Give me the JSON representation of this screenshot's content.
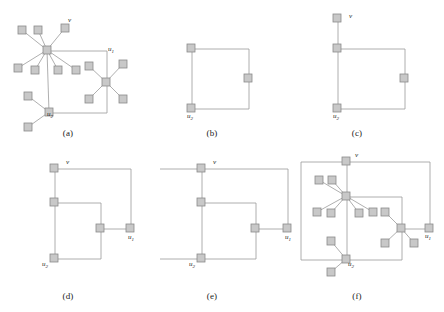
{
  "figure": {
    "background_color": "#ffffff",
    "node_fill": "#c8c8c8",
    "node_stroke": "#8a8a8a",
    "edge_color": "#9a9a9a",
    "label_color": "#1a1a1a",
    "vertex_labels": {
      "v": "v",
      "u1_base": "u",
      "u1_sub": "1",
      "u2_base": "u",
      "u2_sub": "2"
    }
  },
  "panels": [
    {
      "id": "a",
      "caption": "(a)",
      "caption_x": 48,
      "caption_y": 128,
      "origin_x": 2,
      "origin_y": 6,
      "labels": [
        {
          "name": "v",
          "base": "v",
          "sub": "",
          "x": 66,
          "y": 16
        },
        {
          "name": "u1",
          "base": "u",
          "sub": "1",
          "x": 106,
          "y": 45
        },
        {
          "name": "u2",
          "base": "u",
          "sub": "2",
          "x": 45,
          "y": 110
        }
      ],
      "nodes": [
        {
          "name": "hub-v",
          "x": 41,
          "y": 40
        },
        {
          "name": "hub-u1",
          "x": 100,
          "y": 72
        },
        {
          "name": "hub-u2",
          "x": 43,
          "y": 102
        },
        {
          "name": "leaf-v-1",
          "x": 16,
          "y": 20
        },
        {
          "name": "leaf-v-2",
          "x": 32,
          "y": 20
        },
        {
          "name": "leaf-v-3",
          "x": 59,
          "y": 18
        },
        {
          "name": "leaf-v-4",
          "x": 12,
          "y": 58
        },
        {
          "name": "leaf-v-5",
          "x": 29,
          "y": 60
        },
        {
          "name": "leaf-v-6",
          "x": 52,
          "y": 60
        },
        {
          "name": "leaf-v-7",
          "x": 70,
          "y": 60
        },
        {
          "name": "leaf-u1-1",
          "x": 83,
          "y": 56
        },
        {
          "name": "leaf-u1-2",
          "x": 117,
          "y": 54
        },
        {
          "name": "leaf-u1-3",
          "x": 83,
          "y": 89
        },
        {
          "name": "leaf-u1-4",
          "x": 117,
          "y": 89
        },
        {
          "name": "leaf-u2-1",
          "x": 22,
          "y": 86
        },
        {
          "name": "leaf-u2-2",
          "x": 22,
          "y": 117
        }
      ],
      "edges": [
        {
          "from": "hub-v",
          "to": "leaf-v-1"
        },
        {
          "from": "hub-v",
          "to": "leaf-v-2"
        },
        {
          "from": "hub-v",
          "to": "leaf-v-3"
        },
        {
          "from": "hub-v",
          "to": "leaf-v-4"
        },
        {
          "from": "hub-v",
          "to": "leaf-v-5"
        },
        {
          "from": "hub-v",
          "to": "leaf-v-6"
        },
        {
          "from": "hub-v",
          "to": "leaf-v-7"
        },
        {
          "from": "hub-u1",
          "to": "leaf-u1-1"
        },
        {
          "from": "hub-u1",
          "to": "leaf-u1-2"
        },
        {
          "from": "hub-u1",
          "to": "leaf-u1-3"
        },
        {
          "from": "hub-u1",
          "to": "leaf-u1-4"
        },
        {
          "from": "hub-u2",
          "to": "leaf-u2-1"
        },
        {
          "from": "hub-u2",
          "to": "leaf-u2-2"
        },
        {
          "from": "hub-v",
          "to": "hub-u2"
        }
      ],
      "polyline_edges": [
        [
          [
            46,
            45
          ],
          [
            105,
            45
          ],
          [
            105,
            77
          ]
        ],
        [
          [
            48,
            107
          ],
          [
            105,
            107
          ],
          [
            105,
            77
          ]
        ]
      ]
    },
    {
      "id": "b",
      "caption": "(b)",
      "caption_x": 192,
      "caption_y": 128,
      "origin_x": 160,
      "origin_y": 6,
      "labels": [
        {
          "name": "u2",
          "base": "u",
          "sub": "2",
          "x": 27,
          "y": 112
        }
      ],
      "nodes": [
        {
          "name": "node-top-left",
          "x": 27,
          "y": 38
        },
        {
          "name": "node-right",
          "x": 84,
          "y": 68
        },
        {
          "name": "node-bottom-left",
          "x": 27,
          "y": 98
        }
      ],
      "edges": [],
      "polyline_edges": [
        [
          [
            32,
            43
          ],
          [
            89,
            43
          ],
          [
            89,
            73
          ]
        ],
        [
          [
            32,
            103
          ],
          [
            89,
            103
          ],
          [
            89,
            73
          ]
        ],
        [
          [
            32,
            43
          ],
          [
            32,
            103
          ]
        ]
      ]
    },
    {
      "id": "c",
      "caption": "(c)",
      "caption_x": 337,
      "caption_y": 128,
      "origin_x": 300,
      "origin_y": 6,
      "labels": [
        {
          "name": "v",
          "base": "v",
          "sub": "",
          "x": 49,
          "y": 12
        },
        {
          "name": "u2",
          "base": "u",
          "sub": "2",
          "x": 33,
          "y": 112
        }
      ],
      "nodes": [
        {
          "name": "node-v",
          "x": 33,
          "y": 8
        },
        {
          "name": "node-top-left",
          "x": 33,
          "y": 38
        },
        {
          "name": "node-right",
          "x": 100,
          "y": 68
        },
        {
          "name": "node-bottom-left",
          "x": 33,
          "y": 98
        }
      ],
      "edges": [],
      "polyline_edges": [
        [
          [
            38,
            13
          ],
          [
            38,
            43
          ]
        ],
        [
          [
            38,
            43
          ],
          [
            105,
            43
          ],
          [
            105,
            73
          ]
        ],
        [
          [
            38,
            103
          ],
          [
            105,
            103
          ],
          [
            105,
            73
          ]
        ],
        [
          [
            38,
            43
          ],
          [
            38,
            103
          ]
        ]
      ]
    },
    {
      "id": "d",
      "caption": "(d)",
      "caption_x": 48,
      "caption_y": 291,
      "origin_x": 18,
      "origin_y": 152,
      "labels": [
        {
          "name": "v",
          "base": "v",
          "sub": "",
          "x": 48,
          "y": 12
        },
        {
          "name": "u1",
          "base": "u",
          "sub": "1",
          "x": 110,
          "y": 87
        },
        {
          "name": "u2",
          "base": "u",
          "sub": "2",
          "x": 24,
          "y": 114
        }
      ],
      "nodes": [
        {
          "name": "node-v",
          "x": 32,
          "y": 12
        },
        {
          "name": "node-mid-left",
          "x": 32,
          "y": 46
        },
        {
          "name": "node-center",
          "x": 78,
          "y": 72
        },
        {
          "name": "node-u1",
          "x": 108,
          "y": 72
        },
        {
          "name": "node-u2",
          "x": 32,
          "y": 102
        }
      ],
      "edges": [],
      "polyline_edges": [
        [
          [
            37,
            17
          ],
          [
            113,
            17
          ],
          [
            113,
            77
          ]
        ],
        [
          [
            37,
            17
          ],
          [
            37,
            51
          ]
        ],
        [
          [
            37,
            51
          ],
          [
            37,
            107
          ]
        ],
        [
          [
            37,
            51
          ],
          [
            83,
            51
          ],
          [
            83,
            77
          ]
        ],
        [
          [
            37,
            107
          ],
          [
            83,
            107
          ],
          [
            83,
            77
          ]
        ],
        [
          [
            83,
            77
          ],
          [
            113,
            77
          ]
        ]
      ]
    },
    {
      "id": "e",
      "caption": "(e)",
      "caption_x": 192,
      "caption_y": 291,
      "origin_x": 158,
      "origin_y": 152,
      "labels": [
        {
          "name": "v",
          "base": "v",
          "sub": "",
          "x": 55,
          "y": 12
        },
        {
          "name": "u1",
          "base": "u",
          "sub": "1",
          "x": 127,
          "y": 87
        },
        {
          "name": "u2",
          "base": "u",
          "sub": "2",
          "x": 31,
          "y": 114
        }
      ],
      "nodes": [
        {
          "name": "node-v",
          "x": 39,
          "y": 12
        },
        {
          "name": "node-mid-left",
          "x": 39,
          "y": 46
        },
        {
          "name": "node-center",
          "x": 93,
          "y": 72
        },
        {
          "name": "node-u1",
          "x": 125,
          "y": 72
        },
        {
          "name": "node-u2",
          "x": 39,
          "y": 102
        }
      ],
      "edges": [],
      "polyline_edges": [
        [
          [
            44,
            17
          ],
          [
            130,
            17
          ],
          [
            130,
            77
          ]
        ],
        [
          [
            44,
            17
          ],
          [
            44,
            51
          ]
        ],
        [
          [
            44,
            51
          ],
          [
            44,
            107
          ]
        ],
        [
          [
            44,
            51
          ],
          [
            98,
            51
          ],
          [
            98,
            77
          ]
        ],
        [
          [
            44,
            107
          ],
          [
            98,
            107
          ],
          [
            98,
            77
          ]
        ],
        [
          [
            98,
            77
          ],
          [
            130,
            77
          ]
        ],
        [
          [
            44,
            17
          ],
          [
            2,
            17
          ]
        ],
        [
          [
            44,
            107
          ],
          [
            2,
            107
          ]
        ]
      ]
    },
    {
      "id": "f",
      "caption": "(f)",
      "caption_x": 337,
      "caption_y": 291,
      "origin_x": 297,
      "origin_y": 150,
      "labels": [
        {
          "name": "v",
          "base": "v",
          "sub": "",
          "x": 58,
          "y": 7
        },
        {
          "name": "u1",
          "base": "u",
          "sub": "1",
          "x": 128,
          "y": 88
        },
        {
          "name": "u2",
          "base": "u",
          "sub": "2",
          "x": 51,
          "y": 116
        }
      ],
      "nodes": [
        {
          "name": "node-v",
          "x": 45,
          "y": 7
        },
        {
          "name": "hub-v",
          "x": 45,
          "y": 42
        },
        {
          "name": "hub-u1",
          "x": 100,
          "y": 74
        },
        {
          "name": "node-u1",
          "x": 128,
          "y": 74
        },
        {
          "name": "hub-u2",
          "x": 45,
          "y": 105
        },
        {
          "name": "leaf-v-1",
          "x": 18,
          "y": 26
        },
        {
          "name": "leaf-v-2",
          "x": 31,
          "y": 26
        },
        {
          "name": "leaf-v-3",
          "x": 16,
          "y": 58
        },
        {
          "name": "leaf-v-4",
          "x": 30,
          "y": 59
        },
        {
          "name": "leaf-v-5",
          "x": 58,
          "y": 59
        },
        {
          "name": "leaf-v-6",
          "x": 72,
          "y": 58
        },
        {
          "name": "leaf-u1-1",
          "x": 84,
          "y": 58
        },
        {
          "name": "leaf-u1-2",
          "x": 84,
          "y": 89
        },
        {
          "name": "leaf-u1-3",
          "x": 113,
          "y": 89
        },
        {
          "name": "leaf-u2-1",
          "x": 30,
          "y": 87
        },
        {
          "name": "leaf-u2-2",
          "x": 30,
          "y": 118
        }
      ],
      "edges": [
        {
          "from": "hub-v",
          "to": "leaf-v-1"
        },
        {
          "from": "hub-v",
          "to": "leaf-v-2"
        },
        {
          "from": "hub-v",
          "to": "leaf-v-3"
        },
        {
          "from": "hub-v",
          "to": "leaf-v-4"
        },
        {
          "from": "hub-v",
          "to": "leaf-v-5"
        },
        {
          "from": "hub-v",
          "to": "leaf-v-6"
        },
        {
          "from": "hub-u1",
          "to": "leaf-u1-1"
        },
        {
          "from": "hub-u1",
          "to": "leaf-u1-2"
        },
        {
          "from": "hub-u1",
          "to": "leaf-u1-3"
        },
        {
          "from": "hub-u2",
          "to": "leaf-u2-1"
        },
        {
          "from": "hub-u2",
          "to": "leaf-u2-2"
        }
      ],
      "polyline_edges": [
        [
          [
            50,
            12
          ],
          [
            133,
            12
          ],
          [
            133,
            79
          ]
        ],
        [
          [
            50,
            12
          ],
          [
            50,
            47
          ]
        ],
        [
          [
            50,
            47
          ],
          [
            50,
            110
          ]
        ],
        [
          [
            50,
            47
          ],
          [
            105,
            47
          ],
          [
            105,
            79
          ]
        ],
        [
          [
            50,
            110
          ],
          [
            105,
            110
          ],
          [
            105,
            79
          ]
        ],
        [
          [
            105,
            79
          ],
          [
            133,
            79
          ]
        ],
        [
          [
            50,
            12
          ],
          [
            4,
            12
          ]
        ],
        [
          [
            50,
            110
          ],
          [
            4,
            110
          ]
        ],
        [
          [
            4,
            12
          ],
          [
            4,
            110
          ]
        ]
      ]
    }
  ]
}
